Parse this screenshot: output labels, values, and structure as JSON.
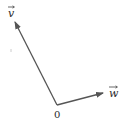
{
  "diagram": {
    "type": "vector-diagram",
    "origin": {
      "label": "0",
      "x": 57,
      "y": 105
    },
    "vectors": [
      {
        "name": "v",
        "label": "v",
        "tip": {
          "x": 15,
          "y": 22
        },
        "label_pos": {
          "x": 11,
          "y": 12
        }
      },
      {
        "name": "w",
        "label": "w",
        "tip": {
          "x": 103,
          "y": 93
        },
        "label_pos": {
          "x": 109,
          "y": 97
        }
      }
    ],
    "colors": {
      "stroke": "#555555",
      "text": "#2a2a2a"
    }
  }
}
